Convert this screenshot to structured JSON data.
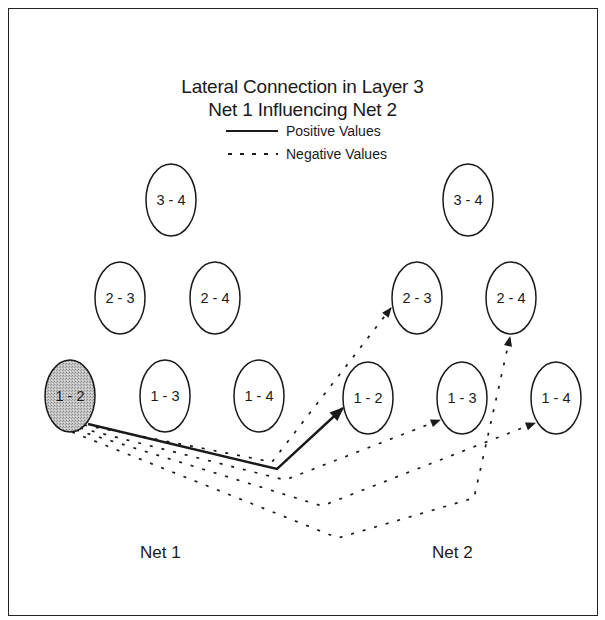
{
  "title": {
    "line1": "Lateral Connection in Layer 3",
    "line2": "Net 1 Influencing Net 2"
  },
  "legend": {
    "positive": {
      "label": "Positive Values",
      "style": "solid"
    },
    "negative": {
      "label": "Negative Values",
      "style": "dashed"
    }
  },
  "nets": [
    {
      "label": "Net 1",
      "nodes": [
        {
          "id": "3-4",
          "label": "3 - 4",
          "cx": 171,
          "cy": 200,
          "highlighted": false
        },
        {
          "id": "2-3",
          "label": "2 - 3",
          "cx": 120,
          "cy": 298,
          "highlighted": false
        },
        {
          "id": "2-4",
          "label": "2 - 4",
          "cx": 215,
          "cy": 298,
          "highlighted": false
        },
        {
          "id": "1-2",
          "label": "1 - 2",
          "cx": 70,
          "cy": 396,
          "highlighted": true
        },
        {
          "id": "1-3",
          "label": "1 - 3",
          "cx": 165,
          "cy": 396,
          "highlighted": false
        },
        {
          "id": "1-4",
          "label": "1 - 4",
          "cx": 259,
          "cy": 396,
          "highlighted": false
        }
      ]
    },
    {
      "label": "Net 2",
      "nodes": [
        {
          "id": "3-4",
          "label": "3 - 4",
          "cx": 468,
          "cy": 200,
          "highlighted": false
        },
        {
          "id": "2-3",
          "label": "2 - 3",
          "cx": 417,
          "cy": 298,
          "highlighted": false
        },
        {
          "id": "2-4",
          "label": "2 - 4",
          "cx": 511,
          "cy": 298,
          "highlighted": false
        },
        {
          "id": "1-2",
          "label": "1 - 2",
          "cx": 368,
          "cy": 398,
          "highlighted": false
        },
        {
          "id": "1-3",
          "label": "1 - 3",
          "cx": 462,
          "cy": 398,
          "highlighted": false
        },
        {
          "id": "1-4",
          "label": "1 - 4",
          "cx": 556,
          "cy": 398,
          "highlighted": false
        }
      ]
    }
  ],
  "connections": [
    {
      "from": "Net 1: 1 - 2",
      "to": "Net 2: 1 - 2",
      "sign": "positive"
    },
    {
      "from": "Net 1: 1 - 2",
      "to": "Net 2: 2 - 3",
      "sign": "negative"
    },
    {
      "from": "Net 1: 1 - 2",
      "to": "Net 2: 1 - 3",
      "sign": "negative"
    },
    {
      "from": "Net 1: 1 - 2",
      "to": "Net 2: 1 - 4",
      "sign": "negative"
    },
    {
      "from": "Net 1: 1 - 2",
      "to": "Net 2: 2 - 4",
      "sign": "negative"
    }
  ],
  "colors": {
    "line": "#1a1a1a",
    "highlight_fill": "#b8b8b8",
    "background": "#ffffff"
  }
}
